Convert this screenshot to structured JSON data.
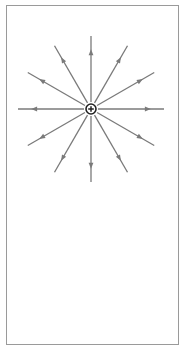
{
  "diagram": {
    "charge": {
      "sign": "+",
      "cx": 91,
      "cy": 109,
      "r": 5
    },
    "field_lines": {
      "count": 12,
      "angles_deg": [
        0,
        30,
        60,
        90,
        120,
        150,
        180,
        210,
        240,
        270,
        300,
        330
      ],
      "inner_radius": 7,
      "outer_radius": 73,
      "arrow_position": 0.82,
      "direction": "outward"
    },
    "colors": {
      "line": "#7a7a7a",
      "charge_stroke": "#222222",
      "frame": "#9a9a9a",
      "background": "#ffffff"
    }
  }
}
